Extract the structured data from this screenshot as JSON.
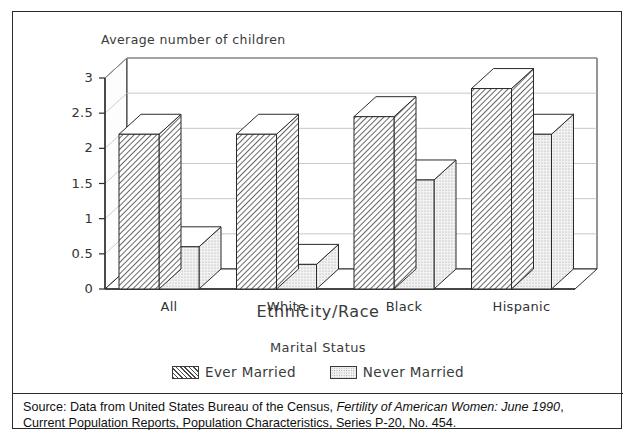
{
  "figure": {
    "y_axis_title": "Average number of children",
    "x_axis_title": "Ethnicity/Race",
    "legend_title": "Marital Status",
    "source_line1_prefix": "Source: Data from United States Bureau of the Census, ",
    "source_line1_italic": "Fertility of American Women: June 1990",
    "source_line1_suffix": ",",
    "source_line2": "Current Population Reports, Population Characteristics, Series P-20, No. 454."
  },
  "legend": {
    "items": [
      {
        "label": "Ever Married",
        "swatch": "hatched-diagonal"
      },
      {
        "label": "Never Married",
        "swatch": "stippled-light"
      }
    ]
  },
  "colors": {
    "ink": "#2b2b2b",
    "gridline": "#b9b9b9",
    "ever_married_fill": "#4b4b4b",
    "never_married_fill": "#e9e9e9",
    "paper": "#ffffff"
  },
  "chart_data": {
    "type": "bar",
    "title": "",
    "subtitle": "",
    "xlabel": "Ethnicity/Race",
    "ylabel": "Average number of children",
    "categories": [
      "All",
      "White",
      "Black",
      "Hispanic"
    ],
    "series": [
      {
        "name": "Ever Married",
        "values": [
          2.2,
          2.2,
          2.45,
          2.85
        ]
      },
      {
        "name": "Never Married",
        "values": [
          0.6,
          0.35,
          1.55,
          2.2
        ]
      }
    ],
    "ylim": [
      0,
      3
    ],
    "yticks": [
      0,
      0.5,
      1,
      1.5,
      2,
      2.5,
      3
    ],
    "ytick_labels": [
      "0",
      "0.5",
      "1",
      "1.5",
      "2",
      "2.5",
      "3"
    ],
    "grid": true,
    "grid_axis": "y",
    "legend_position": "bottom",
    "style": "3d-isometric-bars"
  }
}
